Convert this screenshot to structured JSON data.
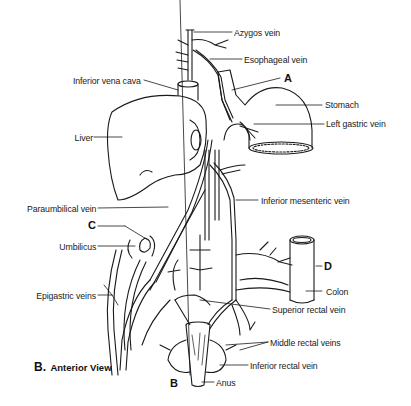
{
  "figure": {
    "caption_prefix": "B.",
    "caption_text": "Anterior View",
    "labels": {
      "azygos": "Azygos vein",
      "esophageal": "Esophageal vein",
      "ivc": "Inferior vena cava",
      "stomach": "Stomach",
      "left_gastric": "Left gastric vein",
      "liver": "Liver",
      "inferior_mesenteric": "Inferior mesenteric vein",
      "paraumbilical": "Paraumbilical vein",
      "umbilicus": "Umbilicus",
      "colon": "Colon",
      "epigastric": "Epigastric veins",
      "superior_rectal": "Superior rectal vein",
      "middle_rectal": "Middle rectal veins",
      "inferior_rectal": "Inferior rectal vein",
      "anus": "Anus"
    },
    "letters": {
      "a": "A",
      "b": "B",
      "c": "C",
      "d": "D"
    },
    "colors": {
      "line": "#1a1a1a",
      "fill": "#ffffff",
      "shade": "#d9d9d9"
    }
  }
}
